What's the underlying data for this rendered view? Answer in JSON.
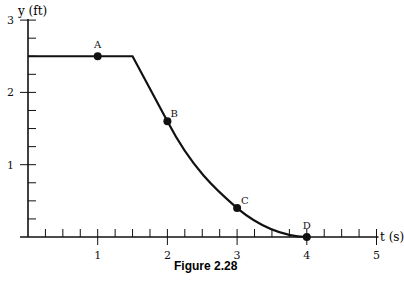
{
  "chart_data": {
    "type": "line",
    "title": "",
    "caption": "Figure 2.28",
    "xlabel": "t (s)",
    "ylabel": "y (ft)",
    "xlim": [
      0,
      5
    ],
    "ylim": [
      0,
      3
    ],
    "x_ticks": [
      "1",
      "2",
      "3",
      "4",
      "5"
    ],
    "y_ticks": [
      "1",
      "2",
      "3"
    ],
    "x_minor_step": 0.25,
    "y_minor_step": 0.25,
    "grid": false,
    "legend": "none",
    "series": [
      {
        "name": "y(t)",
        "x": [
          0,
          1,
          1.5,
          2,
          3,
          4
        ],
        "values": [
          2.5,
          2.5,
          2.5,
          1.6,
          0.4,
          0.0
        ]
      }
    ],
    "points": [
      {
        "label": "A",
        "x": 1,
        "y": 2.5
      },
      {
        "label": "B",
        "x": 2,
        "y": 1.6
      },
      {
        "label": "C",
        "x": 3,
        "y": 0.4
      },
      {
        "label": "D",
        "x": 4,
        "y": 0.0
      }
    ]
  }
}
